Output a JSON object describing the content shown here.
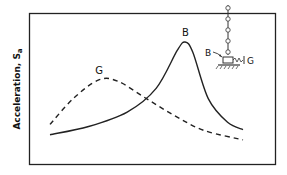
{
  "chart_data": {
    "type": "line",
    "title": "",
    "xlabel": "",
    "ylabel": "Acceleration, S",
    "ylabel_subscript": "a",
    "grid": false,
    "axes_ticks": false,
    "series": [
      {
        "name": "B",
        "label": "B",
        "style": "solid",
        "description": "Base-isolated building response; sharp resonant peak",
        "points": [
          [
            0.0,
            0.1
          ],
          [
            0.2,
            0.18
          ],
          [
            0.4,
            0.32
          ],
          [
            0.55,
            0.55
          ],
          [
            0.66,
            0.92
          ],
          [
            0.7,
            1.0
          ],
          [
            0.74,
            0.9
          ],
          [
            0.82,
            0.45
          ],
          [
            0.92,
            0.22
          ],
          [
            1.0,
            0.15
          ]
        ]
      },
      {
        "name": "G",
        "label": "G",
        "style": "dashed",
        "description": "Ground motion spectrum; broad hump",
        "points": [
          [
            0.0,
            0.2
          ],
          [
            0.12,
            0.45
          ],
          [
            0.25,
            0.63
          ],
          [
            0.35,
            0.62
          ],
          [
            0.5,
            0.45
          ],
          [
            0.65,
            0.28
          ],
          [
            0.8,
            0.14
          ],
          [
            1.0,
            0.05
          ]
        ]
      }
    ],
    "inset": {
      "description": "Building model on isolation base",
      "labels": [
        "B",
        "G"
      ]
    }
  }
}
